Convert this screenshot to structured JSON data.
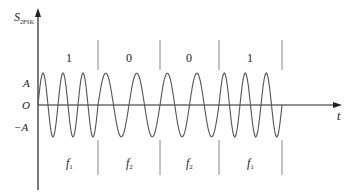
{
  "diagram": {
    "y_axis_label": "S",
    "y_axis_subscript": "2FSK",
    "x_axis_label": "t",
    "origin_label": "O",
    "amp_pos_label": "A",
    "amp_neg_label": "−A",
    "bits": [
      {
        "value": "1",
        "freq": "f",
        "freq_sub": "1",
        "cycles": 3
      },
      {
        "value": "0",
        "freq": "f",
        "freq_sub": "2",
        "cycles": 2
      },
      {
        "value": "0",
        "freq": "f",
        "freq_sub": "2",
        "cycles": 2
      },
      {
        "value": "1",
        "freq": "f",
        "freq_sub": "1",
        "cycles": 3
      }
    ],
    "colors": {
      "axis": "#222222",
      "wave": "#555555",
      "divider": "#888888"
    }
  }
}
